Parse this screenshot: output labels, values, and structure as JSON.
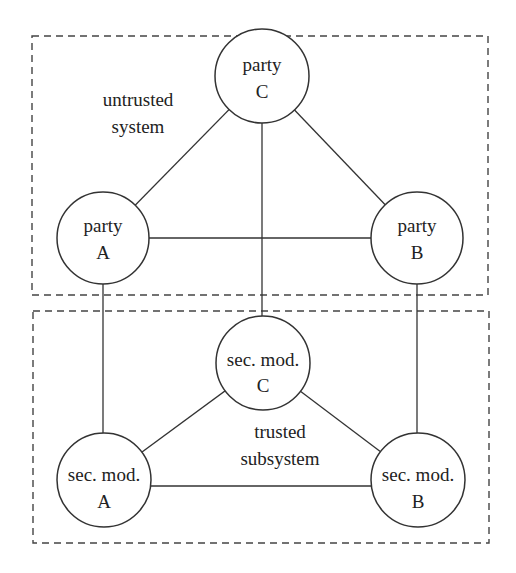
{
  "regions": [
    {
      "id": "untrusted",
      "label_line1": "untrusted",
      "label_line2": "system"
    },
    {
      "id": "trusted",
      "label_line1": "trusted",
      "label_line2": "subsystem"
    }
  ],
  "nodes": {
    "party_c": {
      "line1": "party",
      "line2": "C"
    },
    "party_a": {
      "line1": "party",
      "line2": "A"
    },
    "party_b": {
      "line1": "party",
      "line2": "B"
    },
    "secmod_c": {
      "line1": "sec. mod.",
      "line2": "C"
    },
    "secmod_a": {
      "line1": "sec. mod.",
      "line2": "A"
    },
    "secmod_b": {
      "line1": "sec. mod.",
      "line2": "B"
    }
  },
  "edges": [
    [
      "party_c",
      "party_a"
    ],
    [
      "party_c",
      "party_b"
    ],
    [
      "party_a",
      "party_b"
    ],
    [
      "party_c",
      "secmod_c"
    ],
    [
      "party_a",
      "secmod_a"
    ],
    [
      "party_b",
      "secmod_b"
    ],
    [
      "secmod_c",
      "secmod_a"
    ],
    [
      "secmod_c",
      "secmod_b"
    ],
    [
      "secmod_a",
      "secmod_b"
    ]
  ]
}
